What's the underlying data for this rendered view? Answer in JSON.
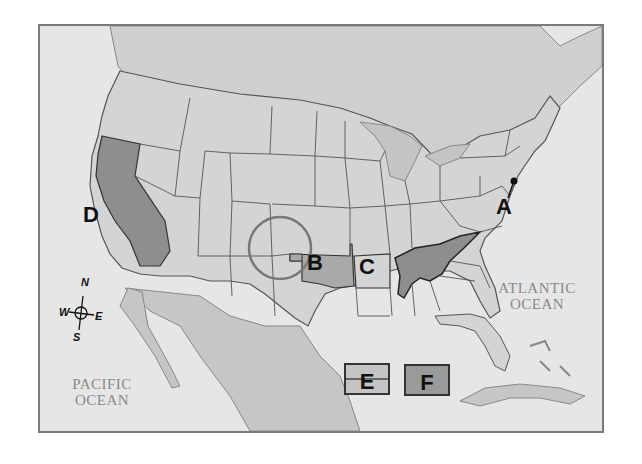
{
  "map": {
    "title": "United States regional map with labeled areas",
    "labels": [
      {
        "id": "A",
        "text": "A",
        "description": "Point marker near Washington D.C. / Virginia"
      },
      {
        "id": "B",
        "text": "B",
        "description": "Oklahoma (shaded)"
      },
      {
        "id": "C",
        "text": "C",
        "description": "Arkansas"
      },
      {
        "id": "D",
        "text": "D",
        "description": "California (shaded dark)"
      }
    ],
    "oceans": {
      "pacific": [
        "PACIFIC",
        "OCEAN"
      ],
      "atlantic": [
        "ATLANTIC",
        "OCEAN"
      ]
    },
    "compass": {
      "n": "N",
      "s": "S",
      "e": "E",
      "w": "W"
    },
    "legend": [
      {
        "id": "E",
        "text": "E",
        "style": "light fill with horizontal line"
      },
      {
        "id": "F",
        "text": "F",
        "style": "dark fill"
      }
    ],
    "highlight_circle": "Circle around Oklahoma panhandle / Four Corners region",
    "shaded_region": "Tennessee and adjacent region (dark shading)",
    "colors": {
      "land": "#d4d4d4",
      "foreign_land": "#c6c6c6",
      "water": "#e8e8e8",
      "shade_dark": "#8e8e8e",
      "shade_mid": "#a9a9a9",
      "border": "#444444",
      "frame": "#7a7a7a"
    }
  }
}
